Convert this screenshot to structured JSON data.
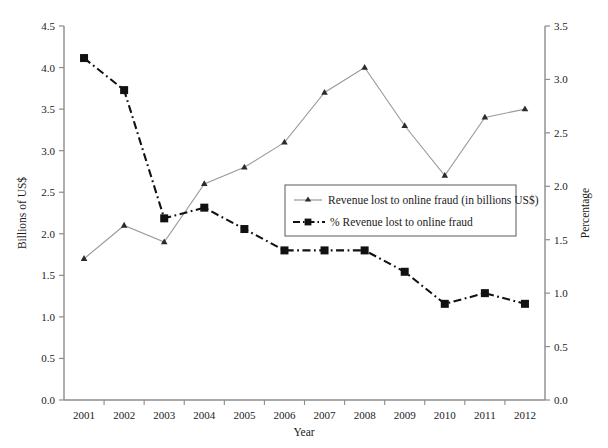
{
  "chart_data": {
    "type": "line",
    "title": "",
    "xlabel": "Year",
    "ylabel": "Billions of US$",
    "y2label": "Percentage",
    "categories": [
      "2001",
      "2002",
      "2003",
      "2004",
      "2005",
      "2006",
      "2007",
      "2008",
      "2009",
      "2010",
      "2011",
      "2012"
    ],
    "ylim": [
      0.0,
      4.5
    ],
    "y2lim": [
      0.0,
      3.5
    ],
    "yticks": [
      "0.0",
      "0.5",
      "1.0",
      "1.5",
      "2.0",
      "2.5",
      "3.0",
      "3.5",
      "4.0",
      "4.5"
    ],
    "y2ticks": [
      "0.0",
      "0.5",
      "1.0",
      "1.5",
      "2.0",
      "2.5",
      "3.0",
      "3.5"
    ],
    "grid": false,
    "legend_position": "center",
    "series": [
      {
        "name": "Revenue lost to online fraud (in billions US$)",
        "axis": "left",
        "marker": "triangle",
        "line_style": "solid",
        "color": "#9a9a9a",
        "values": [
          1.7,
          2.1,
          1.9,
          2.6,
          2.8,
          3.1,
          3.7,
          4.0,
          3.3,
          2.7,
          3.4,
          3.5
        ]
      },
      {
        "name": "% Revenue lost to online fraud",
        "axis": "right",
        "marker": "square",
        "line_style": "dashdot",
        "color": "#111111",
        "values": [
          3.2,
          2.9,
          1.7,
          1.8,
          1.6,
          1.4,
          1.4,
          1.4,
          1.2,
          0.9,
          1.0,
          0.9
        ]
      }
    ]
  },
  "legend": {
    "items": [
      {
        "label": "Revenue lost to online fraud (in billions US$)",
        "marker": "triangle-marker",
        "style": "solid"
      },
      {
        "label": "% Revenue lost to online fraud",
        "marker": "square-marker",
        "style": "dashdot"
      }
    ]
  }
}
